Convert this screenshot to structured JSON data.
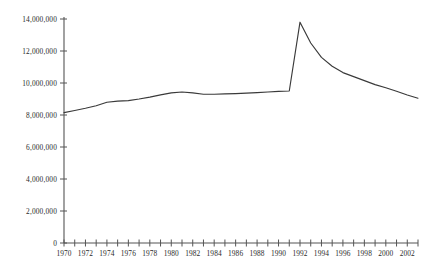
{
  "chart_data": {
    "type": "line",
    "title": "",
    "subtitle": "",
    "xlabel": "",
    "ylabel": "",
    "xlim": [
      1970,
      2003
    ],
    "ylim": [
      0,
      14000000
    ],
    "grid": false,
    "legend": null,
    "y_ticks": [
      0,
      2000000,
      4000000,
      6000000,
      8000000,
      10000000,
      12000000,
      14000000
    ],
    "y_tick_labels": [
      "0",
      "2,000,000",
      "4,000,000",
      "6,000,000",
      "8,000,000",
      "10,000,000",
      "12,000,000",
      "14,000,000"
    ],
    "x_ticks": [
      1970,
      1971,
      1972,
      1973,
      1974,
      1975,
      1976,
      1977,
      1978,
      1979,
      1980,
      1981,
      1982,
      1983,
      1984,
      1985,
      1986,
      1987,
      1988,
      1989,
      1990,
      1991,
      1992,
      1993,
      1994,
      1995,
      1996,
      1997,
      1998,
      1999,
      2000,
      2001,
      2002,
      2003
    ],
    "x_tick_labels": [
      "1970",
      "",
      "1972",
      "",
      "1974",
      "",
      "1976",
      "",
      "1978",
      "",
      "1980",
      "",
      "1982",
      "",
      "1984",
      "",
      "1986",
      "",
      "1988",
      "",
      "1990",
      "",
      "1992",
      "",
      "1994",
      "",
      "1996",
      "",
      "1998",
      "",
      "2000",
      "",
      "2002",
      ""
    ],
    "series": [
      {
        "name": "series-1",
        "color": "#3a3a3a",
        "x": [
          1970,
          1971,
          1972,
          1973,
          1974,
          1975,
          1976,
          1977,
          1978,
          1979,
          1980,
          1981,
          1982,
          1983,
          1984,
          1985,
          1986,
          1987,
          1988,
          1989,
          1990,
          1991,
          1992,
          1993,
          1994,
          1995,
          1996,
          1997,
          1998,
          1999,
          2000,
          2001,
          2002,
          2003
        ],
        "values": [
          8150000,
          8280000,
          8420000,
          8580000,
          8800000,
          8870000,
          8900000,
          9000000,
          9120000,
          9260000,
          9380000,
          9440000,
          9380000,
          9300000,
          9300000,
          9320000,
          9340000,
          9370000,
          9400000,
          9440000,
          9480000,
          9500000,
          13800000,
          12500000,
          11600000,
          11050000,
          10650000,
          10400000,
          10150000,
          9900000,
          9700000,
          9480000,
          9250000,
          9050000
        ]
      }
    ]
  },
  "axes": {
    "y_axis_name": "y-axis",
    "x_axis_name": "x-axis"
  }
}
